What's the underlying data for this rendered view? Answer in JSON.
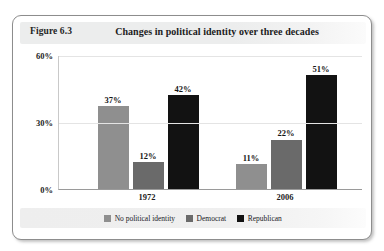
{
  "figure": {
    "number": "Figure 6.3",
    "title": "Changes in political identity over three decades"
  },
  "chart_data": {
    "type": "bar",
    "title": "Changes in political identity over three decades",
    "xlabel": "",
    "ylabel": "",
    "categories": [
      "1972",
      "2006"
    ],
    "ylim": [
      0,
      60
    ],
    "yticks": [
      "0%",
      "30%",
      "60%"
    ],
    "ytick_values": [
      0,
      30,
      60
    ],
    "grid": true,
    "legend_position": "bottom",
    "series": [
      {
        "name": "No political identity",
        "color": "#8f8f8f",
        "values": [
          37,
          11
        ],
        "labels": [
          "37%",
          "11%"
        ]
      },
      {
        "name": "Democrat",
        "color": "#6a6a6a",
        "values": [
          12,
          22
        ],
        "labels": [
          "12%",
          "22%"
        ]
      },
      {
        "name": "Republican",
        "color": "#121212",
        "values": [
          42,
          51
        ],
        "labels": [
          "42%",
          "51%"
        ]
      }
    ]
  }
}
